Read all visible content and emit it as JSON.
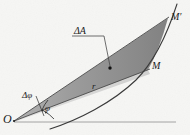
{
  "figure": {
    "kind": "polar-area-element-diagram",
    "width": 190,
    "height": 135,
    "background_color": "#f6f6f4",
    "ink_color": "#1a1a1a"
  },
  "labels": {
    "origin": "O",
    "point_near": "M",
    "point_far": "M′",
    "area_element": "ΔA",
    "radius": "r",
    "angle_increment": "Δφ",
    "angle": "φ"
  },
  "geometry": {
    "origin": {
      "x": 14,
      "y": 121
    },
    "point_M": {
      "x": 148,
      "y": 70
    },
    "point_Mprime": {
      "x": 168,
      "y": 18
    },
    "area_dot": {
      "x": 110,
      "y": 68
    },
    "polar_axis": {
      "x1": 14,
      "y1": 122,
      "x2": 176,
      "y2": 122
    },
    "curve_start": {
      "x": 50,
      "y": 129
    },
    "curve_end": {
      "x": 177,
      "y": 4
    }
  },
  "colors": {
    "wedge_fill": "#8a8a8a",
    "wedge_fill_light": "#b9b9b9",
    "curve_stroke": "#3a3a3a",
    "axis_stroke": "#9a9a9a",
    "leader_stroke": "#4a4a4a"
  }
}
